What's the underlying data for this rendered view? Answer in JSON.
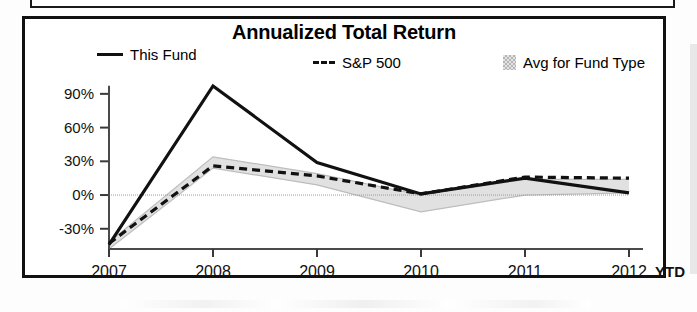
{
  "chart_data": {
    "type": "line",
    "title": "Annualized Total Return",
    "xlabel": "",
    "ylabel": "",
    "x_suffix_label": "YTD",
    "categories": [
      "2007",
      "2008",
      "2009",
      "2010",
      "2011",
      "2012"
    ],
    "ytick_labels": [
      "90%",
      "60%",
      "30%",
      "0%",
      "-30%"
    ],
    "ytick_values": [
      90,
      60,
      30,
      0,
      -30
    ],
    "ylim": [
      -48,
      105
    ],
    "grid": false,
    "zero_line": true,
    "legend_position": "top",
    "series": [
      {
        "name": "This Fund",
        "style": "solid",
        "color": "#111111",
        "values": [
          -44,
          97,
          29,
          1,
          15,
          2
        ]
      },
      {
        "name": "S&P 500",
        "style": "dashed",
        "color": "#111111",
        "values": [
          -43,
          26,
          17,
          1,
          16,
          15
        ]
      },
      {
        "name": "Avg for Fund Type",
        "style": "band",
        "color": "#d8d8d8",
        "upper": [
          -42,
          34,
          19,
          0,
          14,
          14
        ],
        "lower": [
          -48,
          24,
          9,
          -15,
          0,
          2
        ]
      }
    ]
  },
  "legend": {
    "fund_label": "This Fund",
    "sp_label": "S&P 500",
    "avg_label": "Avg for Fund Type"
  },
  "colors": {
    "line": "#111111",
    "band": "#d8d8d8",
    "frame": "#111111"
  }
}
